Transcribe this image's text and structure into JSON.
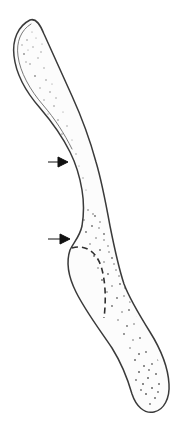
{
  "figure": {
    "caption": "",
    "background_color": "#ffffff",
    "outline_color": "#3a3a3a",
    "fill_color": "#fcfcfc",
    "stipple_color": "#8d8d8d",
    "dashed_line_color": "#2e2e2e",
    "arrow_color": "#111111",
    "width": 186,
    "height": 432
  },
  "chart_data": {
    "type": "diagram",
    "subtitle": "",
    "xlabel": "",
    "ylabel": "",
    "grid": false,
    "legend": false,
    "annotations": [
      {
        "id": "arrow-upper",
        "type": "arrow",
        "label": "",
        "direction": "right",
        "x": 48,
        "y": 162,
        "length": 20,
        "points_to": "superior shaft margin"
      },
      {
        "id": "arrow-lower",
        "type": "arrow",
        "label": "",
        "direction": "right",
        "x": 48,
        "y": 239,
        "length": 22,
        "points_to": "midsection notch margin"
      },
      {
        "id": "dashed-arc",
        "type": "dashed-curve",
        "label": "",
        "start_x": 72,
        "start_y": 248,
        "end_x": 104,
        "end_y": 318,
        "dash_pattern": "6 4",
        "marks": "internal contour within midsection"
      }
    ],
    "regions": [
      {
        "id": "proximal-end",
        "label": "",
        "cx": 40,
        "cy": 55,
        "texture": "stippled",
        "shape": "rounded expansion"
      },
      {
        "id": "shaft",
        "label": "",
        "cx": 78,
        "cy": 175,
        "texture": "sparse stipple",
        "shape": "slender curved column"
      },
      {
        "id": "midsection",
        "label": "",
        "cx": 95,
        "cy": 250,
        "texture": "dense stipple",
        "shape": "broadened body"
      },
      {
        "id": "distal-end",
        "label": "",
        "cx": 140,
        "cy": 380,
        "texture": "dense stipple",
        "shape": "bulbous rounded end"
      }
    ]
  }
}
